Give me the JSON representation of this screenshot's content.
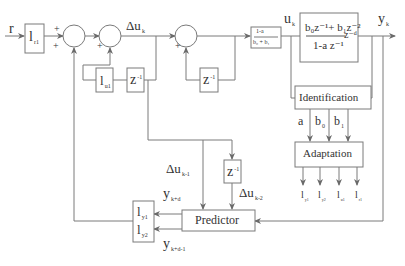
{
  "diagram": {
    "type": "block-diagram",
    "signals": {
      "r": "r",
      "delta_u_k": {
        "main": "Δu",
        "sub": "k"
      },
      "u_k": {
        "main": "u",
        "sub": "k"
      },
      "y_k": {
        "main": "y",
        "sub": "k"
      },
      "delta_u_k1": {
        "main": "Δu",
        "sub": "k-1"
      },
      "delta_u_k2": {
        "main": "Δu",
        "sub": "k-2"
      },
      "y_kd": {
        "main": "y",
        "sub": "k+d"
      },
      "y_kd1": {
        "main": "y",
        "sub": "k+d-1"
      },
      "a": "a",
      "b0": {
        "main": "b",
        "sub": "0"
      },
      "b1": {
        "main": "b",
        "sub": "1"
      }
    },
    "signs": {
      "sum1_top": "+",
      "sum1_left": "+",
      "sum2_left": "+",
      "sum3_left": "+"
    },
    "blocks": {
      "lr1": {
        "main": "l",
        "sub": "r1"
      },
      "lu1": {
        "main": "l",
        "sub": "u1"
      },
      "z1a": {
        "main": "z",
        "sup": "-1"
      },
      "z1b": {
        "main": "z",
        "sup": "-1"
      },
      "z1c": {
        "main": "z",
        "sup": "-1"
      },
      "gain": {
        "num": "1-a",
        "den": "b₀ + b₁"
      },
      "plant": {
        "num": "b₀z⁻¹+ b₁z⁻²",
        "den": "1-a z⁻¹",
        "delay": "z⁻ᵈ"
      },
      "identification": "Identification",
      "adaptation": "Adaptation",
      "predictor": "Predictor",
      "ly1": {
        "main": "l",
        "sub": "y1"
      },
      "ly2": {
        "main": "l",
        "sub": "y2"
      }
    },
    "adaptation_outputs": [
      {
        "main": "l",
        "sub": "y1"
      },
      {
        "main": "l",
        "sub": "y2"
      },
      {
        "main": "l",
        "sub": "u1"
      },
      {
        "main": "l",
        "sub": "r1"
      }
    ]
  }
}
